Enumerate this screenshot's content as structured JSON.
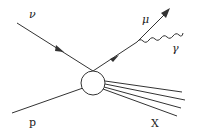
{
  "diagram": {
    "type": "feynman-diagram",
    "colors": {
      "line": "#333333",
      "text": "#222222",
      "background": "#ffffff"
    },
    "labels": {
      "neutrino": "ν",
      "muon": "μ",
      "photon": "γ",
      "proton": "p",
      "hadrons": "X"
    },
    "particles": [
      {
        "id": "neutrino",
        "label": "ν",
        "kind": "fermion-incoming",
        "arrow": true
      },
      {
        "id": "muon",
        "label": "μ",
        "kind": "fermion-outgoing",
        "arrow": true
      },
      {
        "id": "photon",
        "label": "γ",
        "kind": "boson-wavy"
      },
      {
        "id": "proton",
        "label": "p",
        "kind": "incoming-line"
      },
      {
        "id": "hadrons",
        "label": "X",
        "kind": "outgoing-jet",
        "lines": 4
      }
    ],
    "vertex": {
      "kind": "blob-circle"
    }
  }
}
